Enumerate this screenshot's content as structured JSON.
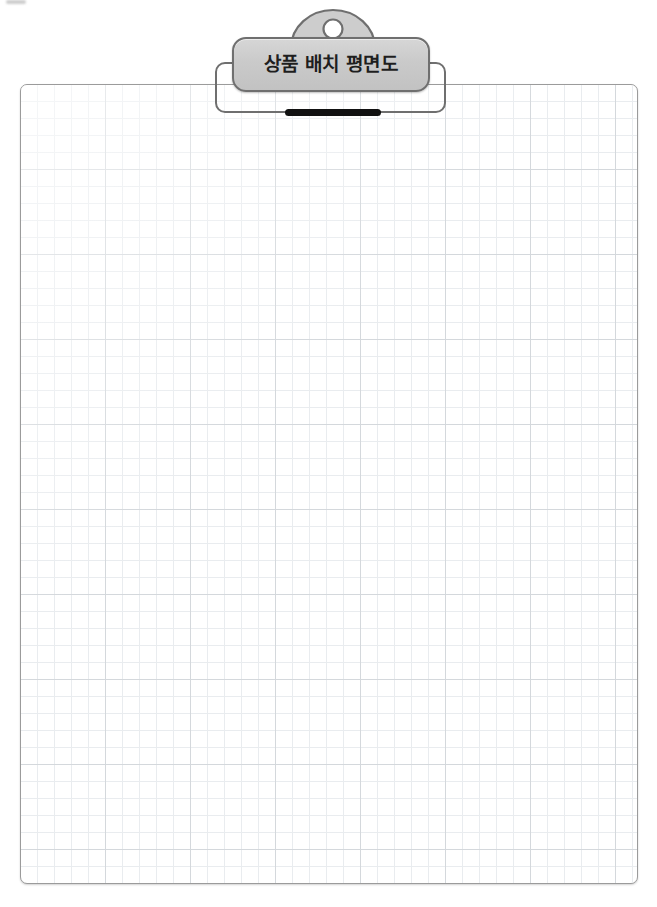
{
  "document": {
    "background_color": "#ffffff",
    "canvas_width": 657,
    "canvas_height": 907
  },
  "clipboard": {
    "title_plate": {
      "label": "상품 배치 평면도",
      "fill_color": "#cdcdcd",
      "border_color": "#6f6f6f"
    },
    "clip_head": {
      "icon": "clip-head-semicircle",
      "hole_icon": "hang-hole-circle",
      "fill_color": "#cdcdcd",
      "border_color": "#6f6f6f"
    },
    "backplate": {
      "icon": "clip-backing-plate",
      "border_color": "#6f6f6f"
    },
    "clamp_bar": {
      "icon": "clamp-bar",
      "color": "#111111"
    }
  },
  "paper": {
    "fill_color": "#ffffff",
    "border_color": "#9b9b9b",
    "grid": {
      "minor_spacing_px": 17,
      "minor_color": "#e9ecef",
      "major_spacing_px": 85,
      "major_color": "#d4d8dc"
    },
    "content": ""
  }
}
